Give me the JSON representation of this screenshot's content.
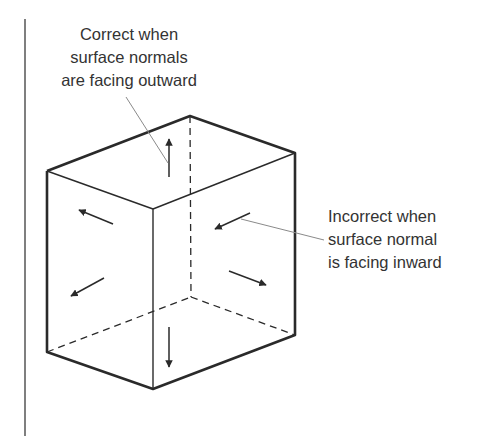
{
  "figure": {
    "type": "box-surface-normals-diagram",
    "colors": {
      "line": "#2a2a2a",
      "leader": "#888888",
      "text": "#333333"
    }
  },
  "annotations": {
    "correct": {
      "lines": [
        "Correct when",
        "surface normals",
        "are facing outward"
      ]
    },
    "incorrect": {
      "lines": [
        "Incorrect when",
        "surface normal",
        "is facing inward"
      ]
    }
  },
  "arrows": [
    {
      "face": "top",
      "direction": "up",
      "orientation": "outward"
    },
    {
      "face": "front-left",
      "direction": "up-left",
      "orientation": "outward"
    },
    {
      "face": "front-left",
      "direction": "down-left",
      "orientation": "outward"
    },
    {
      "face": "front-right",
      "direction": "down-left",
      "orientation": "inward"
    },
    {
      "face": "front-right",
      "direction": "down-right",
      "orientation": "outward"
    },
    {
      "face": "bottom",
      "direction": "down",
      "orientation": "outward"
    }
  ]
}
